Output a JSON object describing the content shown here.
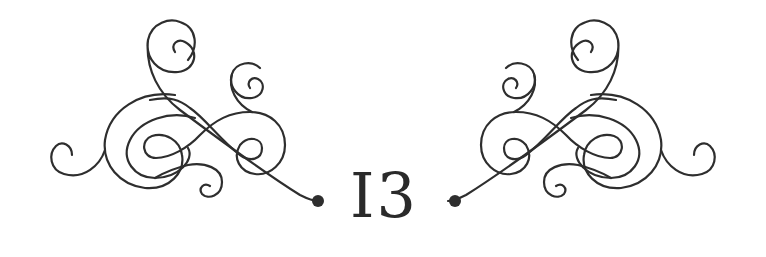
{
  "ornament": {
    "numeral": "I3",
    "stroke_color": "#2e2e2e",
    "background": "#ffffff",
    "left_flourish": "flourish-left",
    "right_flourish": "flourish-right"
  }
}
